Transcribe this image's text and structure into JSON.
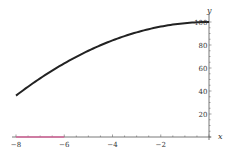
{
  "chart_data": {
    "type": "line",
    "title": "",
    "xlabel": "x",
    "ylabel": "y",
    "xlim": [
      -8,
      0
    ],
    "ylim": [
      0,
      100
    ],
    "grid": false,
    "legend": null,
    "x_ticks": [
      -8,
      -6,
      -4,
      -2
    ],
    "x_tick_labels": [
      "−8",
      "−6",
      "−4",
      "−2"
    ],
    "y_ticks": [
      20,
      40,
      60,
      80,
      100
    ],
    "y_tick_labels": [
      "20",
      "40",
      "60",
      "80",
      "100"
    ],
    "series": [
      {
        "name": "curve",
        "color": "#222222",
        "x": [
          -8,
          -7,
          -6,
          -5,
          -4,
          -3,
          -2,
          -1,
          0
        ],
        "y": [
          36,
          51,
          64,
          75,
          84,
          91,
          96,
          99,
          100
        ]
      },
      {
        "name": "interval-highlight",
        "color": "#d4679a",
        "x": [
          -8,
          -6
        ],
        "y": [
          0,
          0
        ]
      }
    ]
  }
}
